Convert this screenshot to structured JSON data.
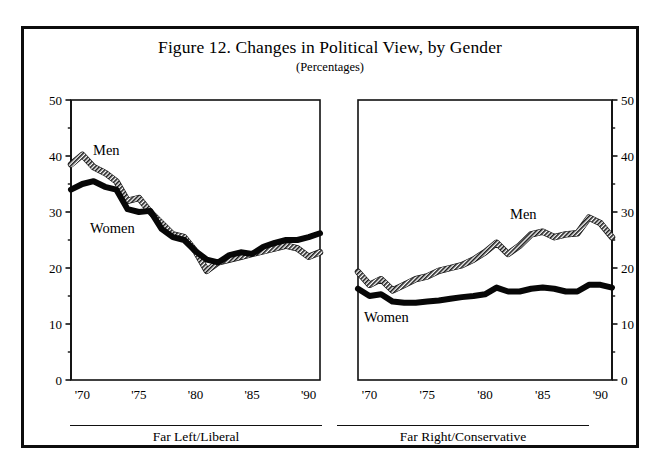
{
  "figure": {
    "title": "Figure 12. Changes in Political View, by Gender",
    "subtitle": "(Percentages)"
  },
  "chart_data": [
    {
      "type": "line",
      "panel": "left",
      "title": "Far Left/Liberal",
      "xlabel": "Far Left/Liberal",
      "ylabel": "",
      "ylim": [
        0,
        50
      ],
      "yticks": [
        0,
        10,
        20,
        30,
        40,
        50
      ],
      "yticks_minor": [
        5,
        15,
        25,
        35,
        45
      ],
      "y_axis_side": "left",
      "xlim": [
        1969,
        1991
      ],
      "xticks": [
        1970,
        1975,
        1980,
        1985,
        1990
      ],
      "xtick_labels": [
        "'70",
        "'75",
        "'80",
        "'85",
        "'90"
      ],
      "grid": false,
      "legend": "inline-annotation",
      "x": [
        1969,
        1970,
        1971,
        1972,
        1973,
        1974,
        1975,
        1976,
        1977,
        1978,
        1979,
        1980,
        1981,
        1982,
        1983,
        1984,
        1985,
        1986,
        1987,
        1988,
        1989,
        1990,
        1991
      ],
      "series": [
        {
          "name": "Men",
          "style": "hatched",
          "values": [
            38.5,
            40.2,
            38.0,
            37.0,
            35.5,
            32.0,
            32.5,
            30.0,
            28.0,
            26.0,
            25.5,
            23.0,
            19.5,
            21.0,
            21.5,
            22.0,
            22.5,
            23.0,
            23.5,
            24.0,
            23.5,
            22.0,
            22.8
          ]
        },
        {
          "name": "Women",
          "style": "solid",
          "values": [
            34.0,
            35.0,
            35.5,
            34.5,
            34.0,
            30.5,
            30.0,
            30.2,
            27.0,
            25.5,
            25.0,
            23.0,
            21.5,
            21.0,
            22.3,
            22.8,
            22.5,
            23.8,
            24.5,
            25.0,
            25.0,
            25.5,
            26.2
          ]
        }
      ]
    },
    {
      "type": "line",
      "panel": "right",
      "title": "Far Right/Conservative",
      "xlabel": "Far Right/Conservative",
      "ylabel": "",
      "ylim": [
        0,
        50
      ],
      "yticks": [
        0,
        10,
        20,
        30,
        40,
        50
      ],
      "yticks_minor": [
        5,
        15,
        25,
        35,
        45
      ],
      "y_axis_side": "right",
      "xlim": [
        1969,
        1991
      ],
      "xticks": [
        1970,
        1975,
        1980,
        1985,
        1990
      ],
      "xtick_labels": [
        "'70",
        "'75",
        "'80",
        "'85",
        "'90"
      ],
      "grid": false,
      "legend": "inline-annotation",
      "x": [
        1969,
        1970,
        1971,
        1972,
        1973,
        1974,
        1975,
        1976,
        1977,
        1978,
        1979,
        1980,
        1981,
        1982,
        1983,
        1984,
        1985,
        1986,
        1987,
        1988,
        1989,
        1990,
        1991
      ],
      "series": [
        {
          "name": "Men",
          "style": "hatched",
          "values": [
            19.3,
            17.0,
            18.0,
            16.0,
            17.0,
            18.0,
            18.5,
            19.5,
            20.0,
            20.5,
            21.5,
            22.8,
            24.5,
            22.5,
            24.0,
            26.0,
            26.5,
            25.5,
            26.0,
            26.2,
            29.0,
            28.0,
            25.5
          ]
        },
        {
          "name": "Women",
          "style": "solid",
          "values": [
            16.3,
            15.0,
            15.3,
            14.0,
            13.8,
            13.8,
            14.0,
            14.2,
            14.5,
            14.8,
            15.0,
            15.3,
            16.5,
            15.8,
            15.8,
            16.3,
            16.5,
            16.3,
            15.8,
            15.8,
            17.0,
            17.0,
            16.5
          ]
        }
      ]
    }
  ],
  "annotations": {
    "left_men": "Men",
    "left_women": "Women",
    "right_men": "Men",
    "right_women": "Women"
  }
}
